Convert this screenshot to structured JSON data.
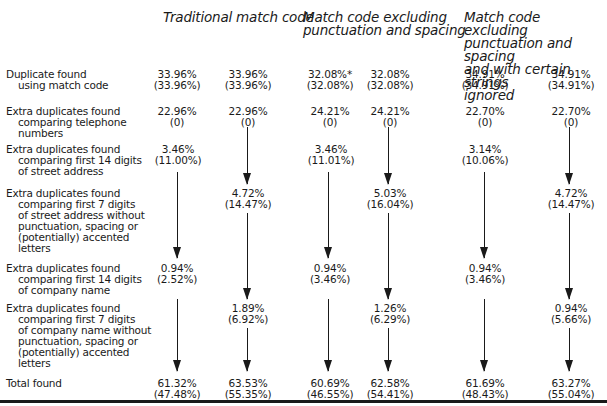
{
  "headers": [
    {
      "label": "Traditional match code"
    },
    {
      "lines": [
        "Match code excluding",
        "punctuation and spacing"
      ]
    },
    {
      "lines": [
        "Match code excluding",
        "punctuation and spacing",
        "and with certain strings",
        "ignored"
      ]
    }
  ],
  "rows": [
    {
      "label": [
        "Duplicate found",
        "using match code"
      ],
      "cells": [
        [
          "33.96%",
          "(33.96%)"
        ],
        [
          "33.96%",
          "(33.96%)"
        ],
        [
          "32.08%*",
          "(32.08%)"
        ],
        [
          "32.08%",
          "(32.08%)"
        ],
        [
          "34.91%",
          "(34.91%)"
        ],
        [
          "34.91%",
          "(34.91%)"
        ]
      ]
    },
    {
      "label": [
        "Extra duplicates found",
        "comparing telephone",
        "numbers"
      ],
      "cells": [
        [
          "22.96%",
          "(0)"
        ],
        [
          "22.96%",
          "(0)"
        ],
        [
          "24.21%",
          "(0)"
        ],
        [
          "24.21%",
          "(0)"
        ],
        [
          "22.70%",
          "(0)"
        ],
        [
          "22.70%",
          "(0)"
        ]
      ]
    },
    {
      "label": [
        "Extra duplicates found",
        "comparing first 14 digits",
        "of street address"
      ],
      "cells": [
        [
          "3.46%",
          "(11.00%)"
        ],
        null,
        [
          "3.46%",
          "(11.01%)"
        ],
        null,
        [
          "3.14%",
          "(10.06%)"
        ],
        null
      ]
    },
    {
      "label": [
        "Extra duplicates found",
        "comparing first 7 digits",
        "of street address without",
        "punctuation, spacing or",
        "(potentially) accented",
        "letters"
      ],
      "cells": [
        null,
        [
          "4.72%",
          "(14.47%)"
        ],
        null,
        [
          "5.03%",
          "(16.04%)"
        ],
        null,
        [
          "4.72%",
          "(14.47%)"
        ]
      ]
    },
    {
      "label": [
        "Extra duplicates found",
        "comparing first 14 digits",
        "of company name"
      ],
      "cells": [
        [
          "0.94%",
          "(2.52%)"
        ],
        null,
        [
          "0.94%",
          "(3.46%)"
        ],
        null,
        [
          "0.94%",
          "(3.46%)"
        ],
        null
      ]
    },
    {
      "label": [
        "Extra duplicates found",
        "comparing first 7 digits",
        "of company name without",
        "punctuation, spacing or",
        "(potentially) accented",
        "letters"
      ],
      "cells": [
        null,
        [
          "1.89%",
          "(6.92%)"
        ],
        null,
        [
          "1.26%",
          "(6.29%)"
        ],
        null,
        [
          "0.94%",
          "(5.66%)"
        ]
      ]
    },
    {
      "label": [
        "Total found"
      ],
      "cells": [
        [
          "61.32%",
          "(47.48%)"
        ],
        [
          "63.53%",
          "(55.35%)"
        ],
        [
          "60.69%",
          "(46.55%)"
        ],
        [
          "62.58%",
          "(54.41%)"
        ],
        [
          "61.69%",
          "(48.43%)"
        ],
        [
          "63.27%",
          "(55.04%)"
        ]
      ]
    }
  ]
}
